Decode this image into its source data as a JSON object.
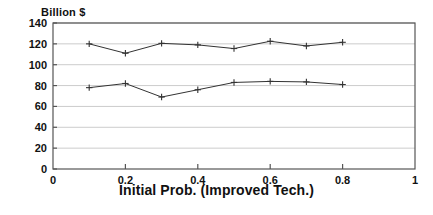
{
  "chart_data": {
    "type": "line",
    "title": "",
    "xlabel": "Initial Prob. (Improved Tech.)",
    "ylabel": "Billion $",
    "xlim": [
      0,
      1
    ],
    "ylim": [
      0,
      140
    ],
    "grid": true,
    "legend_position": "none",
    "x_ticks": [
      "0",
      "0.2",
      "0.4",
      "0.6",
      "0.8",
      "1"
    ],
    "x_tick_values": [
      0,
      0.2,
      0.4,
      0.6,
      0.8,
      1
    ],
    "y_ticks": [
      "0",
      "20",
      "40",
      "60",
      "80",
      "100",
      "120",
      "140"
    ],
    "y_tick_values": [
      0,
      20,
      40,
      60,
      80,
      100,
      120,
      140
    ],
    "x": [
      0.1,
      0.2,
      0.3,
      0.4,
      0.5,
      0.6,
      0.7,
      0.8
    ],
    "series": [
      {
        "name": "upper",
        "values": [
          120,
          111,
          120.5,
          119,
          115.5,
          122.5,
          118,
          121.5
        ],
        "color": "#333333",
        "marker": "plus"
      },
      {
        "name": "lower",
        "values": [
          78,
          82,
          69,
          76,
          83,
          84,
          83.5,
          81
        ],
        "color": "#333333",
        "marker": "plus"
      }
    ],
    "axis_color": "#555555",
    "grid_color": "#cccccc"
  },
  "labels": {
    "ylabel": "Billion $",
    "xlabel": "Initial Prob. (Improved Tech.)"
  }
}
